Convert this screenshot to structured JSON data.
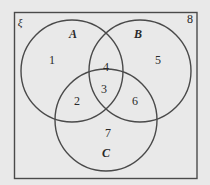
{
  "diagram": {
    "type": "venn",
    "universe": {
      "symbol": "ξ",
      "outside_value": "8"
    },
    "sets": [
      {
        "name": "A",
        "color": "#444444"
      },
      {
        "name": "B",
        "color": "#444444"
      },
      {
        "name": "C",
        "color": "#444444"
      }
    ],
    "regions": {
      "A_only": "1",
      "A_and_C_only": "2",
      "A_and_B_and_C": "3",
      "A_and_B_only": "4",
      "B_only": "5",
      "B_and_C_only": "6",
      "C_only": "7",
      "outside": "8"
    },
    "colors": {
      "background": "#e9e9e9",
      "stroke": "#4a4a4a",
      "text": "#2a2a2a"
    }
  }
}
